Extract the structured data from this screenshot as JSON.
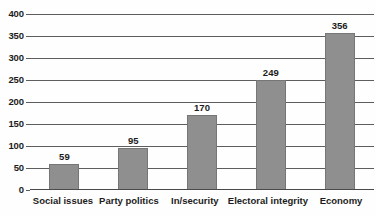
{
  "chart_data": {
    "type": "bar",
    "title": "",
    "subtitle": "",
    "xlabel": "",
    "ylabel": "",
    "categories": [
      "Social issues",
      "Party politics",
      "In/security",
      "Electoral integrity",
      "Economy"
    ],
    "values": [
      59,
      95,
      170,
      249,
      356
    ],
    "data_labels": [
      "59",
      "95",
      "170",
      "249",
      "356"
    ],
    "ylim": [
      0,
      400
    ],
    "ytick_step": 50,
    "ytick_labels": [
      "400",
      "350",
      "300",
      "250",
      "200",
      "150",
      "100",
      "50",
      "0"
    ],
    "ytick_values": [
      400,
      350,
      300,
      250,
      200,
      150,
      100,
      50,
      0
    ],
    "grid": true,
    "grid_axis": "y",
    "legend": false,
    "legend_position": "none",
    "colors": {
      "bar_fill": "#8f8f8f",
      "bar_border": "#767676",
      "gridline": "#5d5d5d",
      "axis": "#4a4a4a",
      "text": "#1c1c1c",
      "background": "#fefefe"
    }
  }
}
